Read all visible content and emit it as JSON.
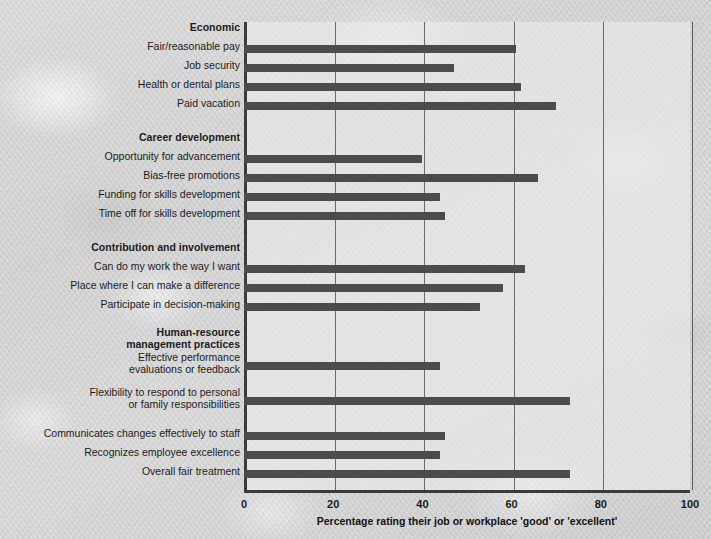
{
  "chart_data": {
    "type": "bar",
    "orientation": "horizontal",
    "title": "",
    "xlabel": "Percentage rating their job or workplace 'good' or 'excellent'",
    "ylabel": "",
    "xlim": [
      0,
      100
    ],
    "xticks": [
      0,
      20,
      40,
      60,
      80,
      100
    ],
    "grid": true,
    "legend": null,
    "bar_color": "#4c4c4c",
    "groups": [
      {
        "name": "Economic",
        "categories": [
          "Fair/reasonable pay",
          "Job security",
          "Health or dental plans",
          "Paid vacation"
        ],
        "values": [
          61,
          47,
          62,
          70
        ]
      },
      {
        "name": "Career development",
        "categories": [
          "Opportunity for advancement",
          "Bias-free promotions",
          "Funding for skills development",
          "Time off for skills development"
        ],
        "values": [
          40,
          66,
          44,
          45
        ]
      },
      {
        "name": "Contribution and involvement",
        "categories": [
          "Can do my work the way I want",
          "Place where I can make a difference",
          "Participate in decision-making"
        ],
        "values": [
          63,
          58,
          53
        ]
      },
      {
        "name": "Human-resource\nmanagement practices",
        "categories": [
          "Effective performance\nevaluations or feedback",
          "Flexibility to respond to personal\nor family responsibilities",
          "Communicates changes effectively to staff",
          "Recognizes employee excellence",
          "Overall fair treatment"
        ],
        "values": [
          44,
          73,
          45,
          44,
          73
        ]
      }
    ],
    "rows": [
      {
        "kind": "group",
        "label": "Economic",
        "value": null,
        "top": 4,
        "label_top": 0,
        "lines": 1
      },
      {
        "kind": "bar",
        "label": "Fair/reasonable pay",
        "value": 61,
        "top": 23,
        "label_top": 19,
        "lines": 1
      },
      {
        "kind": "bar",
        "label": "Job security",
        "value": 47,
        "top": 42,
        "label_top": 38,
        "lines": 1
      },
      {
        "kind": "bar",
        "label": "Health or dental plans",
        "value": 62,
        "top": 61,
        "label_top": 57,
        "lines": 1
      },
      {
        "kind": "bar",
        "label": "Paid vacation",
        "value": 70,
        "top": 80,
        "label_top": 76,
        "lines": 1
      },
      {
        "kind": "group",
        "label": "Career development",
        "value": null,
        "top": 114,
        "label_top": 110,
        "lines": 1
      },
      {
        "kind": "bar",
        "label": "Opportunity for advancement",
        "value": 40,
        "top": 133,
        "label_top": 129,
        "lines": 1
      },
      {
        "kind": "bar",
        "label": "Bias-free promotions",
        "value": 66,
        "top": 152,
        "label_top": 148,
        "lines": 1
      },
      {
        "kind": "bar",
        "label": "Funding for skills development",
        "value": 44,
        "top": 171,
        "label_top": 167,
        "lines": 1
      },
      {
        "kind": "bar",
        "label": "Time off for skills development",
        "value": 45,
        "top": 190,
        "label_top": 186,
        "lines": 1
      },
      {
        "kind": "group",
        "label": "Contribution and involvement",
        "value": null,
        "top": 224,
        "label_top": 220,
        "lines": 1
      },
      {
        "kind": "bar",
        "label": "Can do my work the way I want",
        "value": 63,
        "top": 243,
        "label_top": 239,
        "lines": 1
      },
      {
        "kind": "bar",
        "label": "Place where I can make a difference",
        "value": 58,
        "top": 262,
        "label_top": 258,
        "lines": 1
      },
      {
        "kind": "bar",
        "label": "Participate in decision-making",
        "value": 53,
        "top": 281,
        "label_top": 277,
        "lines": 1
      },
      {
        "kind": "group",
        "label": "Human-resource\nmanagement practices",
        "value": null,
        "top": 315,
        "label_top": 305,
        "lines": 2
      },
      {
        "kind": "bar",
        "label": "Effective performance\nevaluations or feedback",
        "value": 44,
        "top": 340,
        "label_top": 330,
        "lines": 2
      },
      {
        "kind": "bar",
        "label": "Flexibility to respond to personal\nor family responsibilities",
        "value": 73,
        "top": 375,
        "label_top": 365,
        "lines": 2
      },
      {
        "kind": "bar",
        "label": "Communicates changes effectively to staff",
        "value": 45,
        "top": 410,
        "label_top": 406,
        "lines": 1
      },
      {
        "kind": "bar",
        "label": "Recognizes employee excellence",
        "value": 44,
        "top": 429,
        "label_top": 425,
        "lines": 1
      },
      {
        "kind": "bar",
        "label": "Overall fair treatment",
        "value": 73,
        "top": 448,
        "label_top": 444,
        "lines": 1
      }
    ]
  }
}
